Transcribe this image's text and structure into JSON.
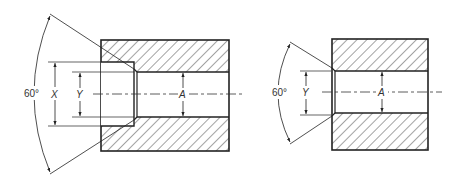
{
  "diagram": {
    "type": "engineering-section-drawing",
    "colors": {
      "line": "#222222",
      "hatch": "#333333",
      "background": "#ffffff"
    },
    "views": [
      {
        "id": "left",
        "description": "Section with counterbore (X), chamfer 60 deg, through bore A",
        "labels": {
          "angle": "60°",
          "outer_diameter": "X",
          "inner_diameter": "Y",
          "bore": "A"
        }
      },
      {
        "id": "right",
        "description": "Section with 60 deg chamfer (Y) and through bore A",
        "labels": {
          "angle": "60°",
          "inner_diameter": "Y",
          "bore": "A"
        }
      }
    ]
  }
}
